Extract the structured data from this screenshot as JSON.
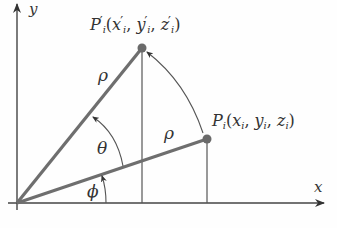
{
  "diagram": {
    "type": "rotation-diagram",
    "colors": {
      "axis": "#444444",
      "radius": "#6e6e6e",
      "arc": "#555555",
      "point": "#6a6a6a",
      "text": "#333333"
    },
    "axes": {
      "x_label": "x",
      "y_label": "y",
      "origin": [
        17,
        203
      ]
    },
    "points": {
      "p": {
        "name": "P",
        "subscript": "i",
        "coords_prefix": "(",
        "x": "x",
        "y": "y",
        "z": "z",
        "coord_sub": "i",
        "sep": ", ",
        "suffix": ")",
        "position": [
          207,
          139
        ]
      },
      "p_prime": {
        "name": "P",
        "prime": "′",
        "subscript": "i",
        "coords_prefix": "(",
        "x": "x",
        "y": "y",
        "z": "z",
        "coord_sub": "i",
        "sep": ", ",
        "suffix": ")",
        "position": [
          142,
          48
        ]
      }
    },
    "labels": {
      "rho_upper": "ρ",
      "rho_lower": "ρ",
      "theta": "θ",
      "phi": "ϕ"
    }
  }
}
